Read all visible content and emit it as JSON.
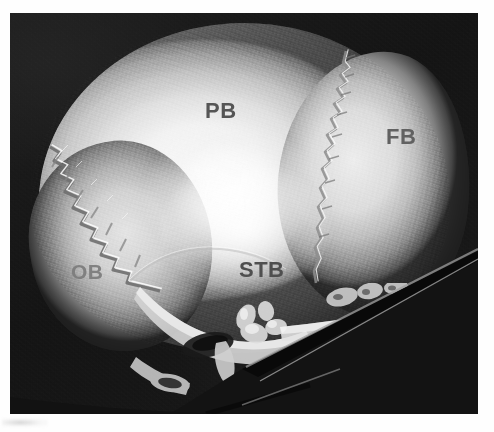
{
  "figure": {
    "modality": "3D CT volume rendering",
    "view": "lateral",
    "background_color": "#121212",
    "page_color": "#ffffff"
  },
  "labels": [
    {
      "id": "pb",
      "text": "PB",
      "meaning": "parietal bone",
      "color": "#555555",
      "x": 195,
      "y": 87
    },
    {
      "id": "fb",
      "text": "FB",
      "meaning": "frontal bone",
      "color": "#616161",
      "x": 376,
      "y": 113
    },
    {
      "id": "ob",
      "text": "OB",
      "meaning": "occipital bone",
      "color": "#7c7c7c",
      "x": 61,
      "y": 248
    },
    {
      "id": "stb",
      "text": "STB",
      "meaning": "squamous temporal bone",
      "color": "#4f4f4f",
      "x": 229,
      "y": 246
    }
  ],
  "features": {
    "coronal_suture": "serrated suture separating parietal and frontal bone",
    "lambdoid_suture": "interdigitated suture separating parietal and occipital bone",
    "squamous_suture": "suture above the squamous temporal bone",
    "cut_plane": "diagonal volume crop through the skull base"
  }
}
